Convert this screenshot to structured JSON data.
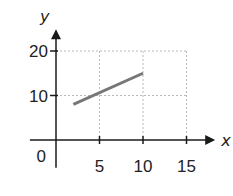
{
  "chart_data": {
    "type": "line",
    "title": "",
    "xlabel": "x",
    "ylabel": "y",
    "xlim": [
      -3,
      16
    ],
    "ylim": [
      -4,
      24
    ],
    "x_ticks": [
      5,
      10,
      15
    ],
    "y_ticks": [
      10,
      20
    ],
    "x_tick_labels": [
      "5",
      "10",
      "15"
    ],
    "y_tick_labels": [
      "10",
      "20"
    ],
    "origin_label": "0",
    "grid": true,
    "grid_style": "dashed",
    "legend": "none",
    "series": [
      {
        "name": "segment",
        "x": [
          2,
          10
        ],
        "y": [
          8,
          15
        ],
        "color": "#777777"
      }
    ]
  }
}
